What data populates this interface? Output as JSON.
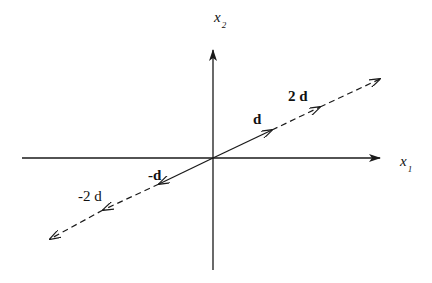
{
  "diagram": {
    "type": "vector-scaling",
    "axes": {
      "x": {
        "label": "x",
        "subscript": "1"
      },
      "y": {
        "label": "x",
        "subscript": "2"
      }
    },
    "vectors": [
      {
        "label": "d",
        "style": "solid",
        "from": [
          0,
          0
        ],
        "to": [
          1,
          1
        ]
      },
      {
        "label": "2 d",
        "style": "dashed",
        "from": [
          0,
          0
        ],
        "to": [
          2,
          2
        ]
      },
      {
        "label": "-d",
        "style": "solid",
        "from": [
          0,
          0
        ],
        "to": [
          -1,
          -1
        ]
      },
      {
        "label": "-2 d",
        "style": "dashed",
        "from": [
          0,
          0
        ],
        "to": [
          -2,
          -2
        ]
      }
    ],
    "colors": {
      "line": "#1a1a1a",
      "background": "#ffffff"
    }
  }
}
